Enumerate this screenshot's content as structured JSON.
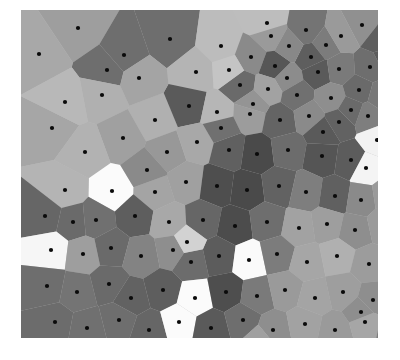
{
  "figure": {
    "title": "",
    "background_color": "#ffffff",
    "plot_background_color": "#bdbdbd",
    "marker_color": "#0a0a0a",
    "marker_radius": 2.1,
    "plot_left": 21,
    "plot_top": 10,
    "plot_width": 357,
    "plot_height": 328
  },
  "chart_data": {
    "type": "scatter",
    "subtype": "voronoi-diagram",
    "title": "",
    "xlabel": "",
    "ylabel": "",
    "grid": false,
    "legend": null,
    "xlim": [
      0,
      357
    ],
    "ylim": [
      0,
      328
    ],
    "colormap": "gray",
    "n_points": 124,
    "points": [
      {
        "x": 57,
        "y": 18,
        "gray": "#9e9e9e"
      },
      {
        "x": 149,
        "y": 29,
        "gray": "#6e6e6e"
      },
      {
        "x": 103,
        "y": 45,
        "gray": "#6e6e6e"
      },
      {
        "x": 86,
        "y": 60,
        "gray": "#6e6e6e"
      },
      {
        "x": 18,
        "y": 44,
        "gray": "#a8a8a8"
      },
      {
        "x": 246,
        "y": 13,
        "gray": "#bdbdbd"
      },
      {
        "x": 341,
        "y": 15,
        "gray": "#909090"
      },
      {
        "x": 250,
        "y": 26,
        "gray": "#9a9a9a"
      },
      {
        "x": 285,
        "y": 20,
        "gray": "#747474"
      },
      {
        "x": 305,
        "y": 35,
        "gray": "#7c7c7c"
      },
      {
        "x": 200,
        "y": 36,
        "gray": "#bcbcbc"
      },
      {
        "x": 230,
        "y": 47,
        "gray": "#8a8a8a"
      },
      {
        "x": 290,
        "y": 47,
        "gray": "#5e5e5e"
      },
      {
        "x": 175,
        "y": 62,
        "gray": "#b4b4b4"
      },
      {
        "x": 81,
        "y": 85,
        "gray": "#b0b0b0"
      },
      {
        "x": 134,
        "y": 110,
        "gray": "#b0b0b0"
      },
      {
        "x": 254,
        "y": 56,
        "gray": "#565656"
      },
      {
        "x": 266,
        "y": 68,
        "gray": "#8c8c8c"
      },
      {
        "x": 297,
        "y": 62,
        "gray": "#5a5a5a"
      },
      {
        "x": 318,
        "y": 59,
        "gray": "#7a7a7a"
      },
      {
        "x": 349,
        "y": 57,
        "gray": "#6e6e6e"
      },
      {
        "x": 366,
        "y": 48,
        "gray": "#5c5c5c"
      },
      {
        "x": 219,
        "y": 75,
        "gray": "#6a6a6a"
      },
      {
        "x": 247,
        "y": 79,
        "gray": "#a2a2a2"
      },
      {
        "x": 276,
        "y": 85,
        "gray": "#707070"
      },
      {
        "x": 310,
        "y": 88,
        "gray": "#8e8e8e"
      },
      {
        "x": 338,
        "y": 80,
        "gray": "#6a6a6a"
      },
      {
        "x": 360,
        "y": 86,
        "gray": "#787878"
      },
      {
        "x": 102,
        "y": 128,
        "gray": "#a0a0a0"
      },
      {
        "x": 168,
        "y": 96,
        "gray": "#5a5a5a"
      },
      {
        "x": 196,
        "y": 102,
        "gray": "#b6b6b6"
      },
      {
        "x": 229,
        "y": 104,
        "gray": "#9c9c9c"
      },
      {
        "x": 259,
        "y": 110,
        "gray": "#646464"
      },
      {
        "x": 288,
        "y": 106,
        "gray": "#8a8a8a"
      },
      {
        "x": 318,
        "y": 112,
        "gray": "#626262"
      },
      {
        "x": 347,
        "y": 106,
        "gray": "#7e7e7e"
      },
      {
        "x": 371,
        "y": 118,
        "gray": "#aaaaaa"
      },
      {
        "x": 31,
        "y": 118,
        "gray": "#a6a6a6"
      },
      {
        "x": 64,
        "y": 142,
        "gray": "#b2b2b2"
      },
      {
        "x": 146,
        "y": 142,
        "gray": "#989898"
      },
      {
        "x": 176,
        "y": 132,
        "gray": "#a8a8a8"
      },
      {
        "x": 208,
        "y": 140,
        "gray": "#606060"
      },
      {
        "x": 236,
        "y": 144,
        "gray": "#4a4a4a"
      },
      {
        "x": 267,
        "y": 140,
        "gray": "#6c6c6c"
      },
      {
        "x": 301,
        "y": 146,
        "gray": "#555555"
      },
      {
        "x": 330,
        "y": 150,
        "gray": "#5c5c5c"
      },
      {
        "x": 345,
        "y": 158,
        "gray": "#f4f4f4"
      },
      {
        "x": 373,
        "y": 152,
        "gray": "#949494"
      },
      {
        "x": 91,
        "y": 181,
        "gray": "#fbfbfb"
      },
      {
        "x": 44,
        "y": 180,
        "gray": "#b4b4b4"
      },
      {
        "x": 134,
        "y": 182,
        "gray": "#a4a4a4"
      },
      {
        "x": 165,
        "y": 172,
        "gray": "#a0a0a0"
      },
      {
        "x": 196,
        "y": 176,
        "gray": "#4e4e4e"
      },
      {
        "x": 226,
        "y": 180,
        "gray": "#4a4a4a"
      },
      {
        "x": 258,
        "y": 176,
        "gray": "#626262"
      },
      {
        "x": 285,
        "y": 182,
        "gray": "#7e7e7e"
      },
      {
        "x": 314,
        "y": 186,
        "gray": "#606060"
      },
      {
        "x": 340,
        "y": 190,
        "gray": "#8a8a8a"
      },
      {
        "x": 366,
        "y": 186,
        "gray": "#9a9a9a"
      },
      {
        "x": 24,
        "y": 206,
        "gray": "#666666"
      },
      {
        "x": 52,
        "y": 212,
        "gray": "#6a6a6a"
      },
      {
        "x": 75,
        "y": 210,
        "gray": "#707070"
      },
      {
        "x": 114,
        "y": 206,
        "gray": "#5e5e5e"
      },
      {
        "x": 148,
        "y": 212,
        "gray": "#a8a8a8"
      },
      {
        "x": 182,
        "y": 210,
        "gray": "#666666"
      },
      {
        "x": 214,
        "y": 216,
        "gray": "#4c4c4c"
      },
      {
        "x": 246,
        "y": 212,
        "gray": "#6e6e6e"
      },
      {
        "x": 278,
        "y": 218,
        "gray": "#a2a2a2"
      },
      {
        "x": 306,
        "y": 214,
        "gray": "#9e9e9e"
      },
      {
        "x": 334,
        "y": 220,
        "gray": "#8e8e8e"
      },
      {
        "x": 362,
        "y": 214,
        "gray": "#9a9a9a"
      },
      {
        "x": 382,
        "y": 224,
        "gray": "#888888"
      },
      {
        "x": 30,
        "y": 240,
        "gray": "#f6f6f6"
      },
      {
        "x": 62,
        "y": 244,
        "gray": "#9e9e9e"
      },
      {
        "x": 90,
        "y": 238,
        "gray": "#6a6a6a"
      },
      {
        "x": 120,
        "y": 246,
        "gray": "#838383"
      },
      {
        "x": 152,
        "y": 240,
        "gray": "#8e8e8e"
      },
      {
        "x": 170,
        "y": 252,
        "gray": "#6c6c6c"
      },
      {
        "x": 198,
        "y": 246,
        "gray": "#5c5c5c"
      },
      {
        "x": 228,
        "y": 250,
        "gray": "#fafafa"
      },
      {
        "x": 256,
        "y": 244,
        "gray": "#7c7c7c"
      },
      {
        "x": 286,
        "y": 252,
        "gray": "#a6a6a6"
      },
      {
        "x": 316,
        "y": 246,
        "gray": "#b0b0b0"
      },
      {
        "x": 348,
        "y": 254,
        "gray": "#9c9c9c"
      },
      {
        "x": 376,
        "y": 248,
        "gray": "#8a8a8a"
      },
      {
        "x": 26,
        "y": 276,
        "gray": "#6e6e6e"
      },
      {
        "x": 56,
        "y": 282,
        "gray": "#747474"
      },
      {
        "x": 88,
        "y": 274,
        "gray": "#6a6a6a"
      },
      {
        "x": 110,
        "y": 288,
        "gray": "#626262"
      },
      {
        "x": 142,
        "y": 280,
        "gray": "#5e5e5e"
      },
      {
        "x": 174,
        "y": 288,
        "gray": "#fbfbfb"
      },
      {
        "x": 205,
        "y": 282,
        "gray": "#4e4e4e"
      },
      {
        "x": 236,
        "y": 286,
        "gray": "#7a7a7a"
      },
      {
        "x": 264,
        "y": 280,
        "gray": "#9a9a9a"
      },
      {
        "x": 294,
        "y": 288,
        "gray": "#a4a4a4"
      },
      {
        "x": 322,
        "y": 282,
        "gray": "#9e9e9e"
      },
      {
        "x": 352,
        "y": 290,
        "gray": "#8e8e8e"
      },
      {
        "x": 378,
        "y": 284,
        "gray": "#949494"
      },
      {
        "x": 34,
        "y": 312,
        "gray": "#6c6c6c"
      },
      {
        "x": 66,
        "y": 318,
        "gray": "#707070"
      },
      {
        "x": 98,
        "y": 310,
        "gray": "#6e6e6e"
      },
      {
        "x": 128,
        "y": 320,
        "gray": "#666666"
      },
      {
        "x": 158,
        "y": 312,
        "gray": "#fbfbfb"
      },
      {
        "x": 190,
        "y": 318,
        "gray": "#5a5a5a"
      },
      {
        "x": 222,
        "y": 310,
        "gray": "#6e6e6e"
      },
      {
        "x": 252,
        "y": 320,
        "gray": "#8e8e8e"
      },
      {
        "x": 284,
        "y": 314,
        "gray": "#a2a2a2"
      },
      {
        "x": 314,
        "y": 320,
        "gray": "#9a9a9a"
      },
      {
        "x": 344,
        "y": 312,
        "gray": "#a6a6a6"
      },
      {
        "x": 372,
        "y": 318,
        "gray": "#7e7e7e"
      },
      {
        "x": 232,
        "y": 94,
        "gray": "#949494"
      },
      {
        "x": 330,
        "y": 100,
        "gray": "#6a6a6a"
      },
      {
        "x": 118,
        "y": 68,
        "gray": "#a4a4a4"
      },
      {
        "x": 208,
        "y": 60,
        "gray": "#c4c4c4"
      },
      {
        "x": 268,
        "y": 36,
        "gray": "#888888"
      },
      {
        "x": 320,
        "y": 26,
        "gray": "#9a9a9a"
      },
      {
        "x": 360,
        "y": 30,
        "gray": "#5e5e5e"
      },
      {
        "x": 126,
        "y": 160,
        "gray": "#8a8a8a"
      },
      {
        "x": 44,
        "y": 92,
        "gray": "#b8b8b8"
      },
      {
        "x": 200,
        "y": 118,
        "gray": "#707070"
      },
      {
        "x": 356,
        "y": 130,
        "gray": "#f2f2f2"
      },
      {
        "x": 302,
        "y": 122,
        "gray": "#5a5a5a"
      },
      {
        "x": 166,
        "y": 232,
        "gray": "#d2d2d2"
      },
      {
        "x": 340,
        "y": 302,
        "gray": "#8e8e8e"
      },
      {
        "x": 240,
        "y": 330,
        "gray": "#a0a0a0"
      }
    ]
  }
}
